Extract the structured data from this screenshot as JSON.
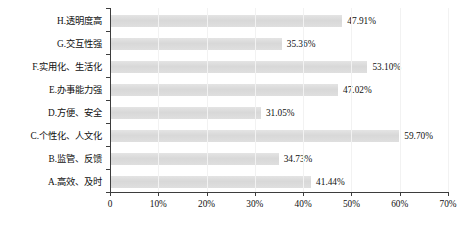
{
  "chart_data": {
    "type": "bar",
    "orientation": "horizontal",
    "title": "",
    "subtitle": "",
    "xlabel": "",
    "ylabel": "",
    "xlim": [
      0,
      70
    ],
    "xticks": [
      "0",
      "10%",
      "20%",
      "30%",
      "40%",
      "50%",
      "60%",
      "70%"
    ],
    "xtick_values": [
      0,
      10,
      20,
      30,
      40,
      50,
      60,
      70
    ],
    "grid": false,
    "legend": null,
    "legend_position": "none",
    "bar_color": "#dcdcdc",
    "axis_color": "#3d3d3d",
    "value_suffix": "%",
    "categories": [
      "H.透明度高",
      "G.交互性强",
      "F.实用化、生活化",
      "E.办事能力强",
      "D.方便、安全",
      "C.个性化、人文化",
      "B.监管、反馈",
      "A.高效、及时"
    ],
    "values": [
      47.91,
      35.36,
      53.1,
      47.02,
      31.05,
      59.7,
      34.73,
      41.44
    ],
    "data_labels": [
      "47.91%",
      "35.36%",
      "53.10%",
      "47.02%",
      "31.05%",
      "59.70%",
      "34.73%",
      "41.44%"
    ]
  },
  "caption": {
    "text": ""
  }
}
